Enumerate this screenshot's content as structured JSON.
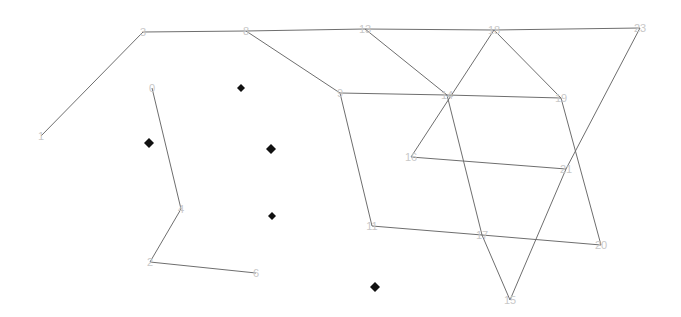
{
  "diagram": {
    "type": "graph",
    "colors": {
      "edge": "#6e6e6e",
      "label": "#c8c8c8",
      "marker": "#111111",
      "background": "#ffffff"
    },
    "nodes": [
      {
        "id": "0",
        "label": "0",
        "x": 152,
        "y": 88
      },
      {
        "id": "1",
        "label": "1",
        "x": 41,
        "y": 136
      },
      {
        "id": "2",
        "label": "2",
        "x": 150,
        "y": 262
      },
      {
        "id": "3",
        "label": "3",
        "x": 143,
        "y": 32
      },
      {
        "id": "4",
        "label": "4",
        "x": 181,
        "y": 209
      },
      {
        "id": "6",
        "label": "6",
        "x": 256,
        "y": 273
      },
      {
        "id": "8",
        "label": "8",
        "x": 246,
        "y": 31
      },
      {
        "id": "9",
        "label": "9",
        "x": 340,
        "y": 93
      },
      {
        "id": "11",
        "label": "11",
        "x": 372,
        "y": 226
      },
      {
        "id": "13",
        "label": "13",
        "x": 365,
        "y": 29
      },
      {
        "id": "14",
        "label": "14",
        "x": 447,
        "y": 95
      },
      {
        "id": "15",
        "label": "15",
        "x": 510,
        "y": 300
      },
      {
        "id": "16",
        "label": "16",
        "x": 411,
        "y": 157
      },
      {
        "id": "17",
        "label": "17",
        "x": 482,
        "y": 235
      },
      {
        "id": "18",
        "label": "18",
        "x": 494,
        "y": 30
      },
      {
        "id": "19",
        "label": "19",
        "x": 561,
        "y": 98
      },
      {
        "id": "20",
        "label": "20",
        "x": 601,
        "y": 245
      },
      {
        "id": "21",
        "label": "21",
        "x": 566,
        "y": 169
      },
      {
        "id": "23",
        "label": "23",
        "x": 640,
        "y": 28
      }
    ],
    "edges": [
      [
        "1",
        "3"
      ],
      [
        "3",
        "8"
      ],
      [
        "8",
        "13"
      ],
      [
        "13",
        "18"
      ],
      [
        "18",
        "23"
      ],
      [
        "8",
        "9"
      ],
      [
        "9",
        "14"
      ],
      [
        "14",
        "19"
      ],
      [
        "13",
        "14"
      ],
      [
        "14",
        "17"
      ],
      [
        "17",
        "15"
      ],
      [
        "18",
        "16"
      ],
      [
        "16",
        "21"
      ],
      [
        "18",
        "19"
      ],
      [
        "19",
        "20"
      ],
      [
        "23",
        "21"
      ],
      [
        "21",
        "15"
      ],
      [
        "9",
        "11"
      ],
      [
        "11",
        "17"
      ],
      [
        "17",
        "20"
      ],
      [
        "0",
        "4"
      ],
      [
        "4",
        "2"
      ],
      [
        "2",
        "6"
      ]
    ],
    "markers": [
      {
        "shape": "diamond",
        "x": 241,
        "y": 88,
        "size": 4
      },
      {
        "shape": "diamond",
        "x": 149,
        "y": 143,
        "size": 5
      },
      {
        "shape": "diamond",
        "x": 271,
        "y": 149,
        "size": 5
      },
      {
        "shape": "diamond",
        "x": 272,
        "y": 216,
        "size": 4
      },
      {
        "shape": "diamond",
        "x": 375,
        "y": 287,
        "size": 5
      }
    ]
  }
}
